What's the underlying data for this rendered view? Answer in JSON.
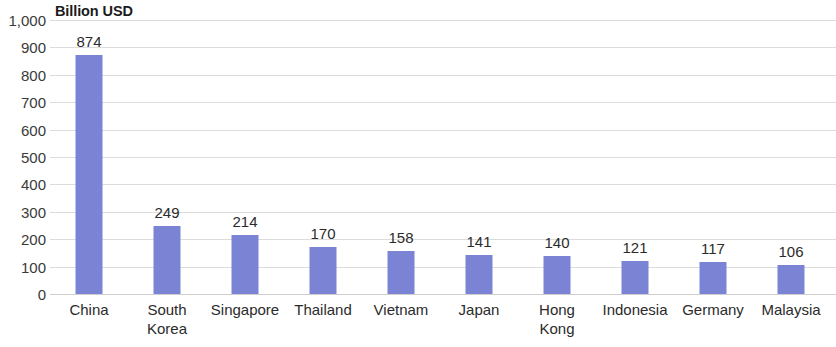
{
  "chart_data": {
    "type": "bar",
    "title": "Billion USD",
    "subtitle": "",
    "xlabel": "",
    "ylabel": "Billion USD",
    "ylim": [
      0,
      1000
    ],
    "ytick_step": 100,
    "grid": true,
    "legend": null,
    "bar_color": "#7b83d4",
    "gridline_color": "#dcdcdc",
    "categories": [
      "China",
      "South\nKorea",
      "Singapore",
      "Thailand",
      "Vietnam",
      "Japan",
      "Hong\nKong",
      "Indonesia",
      "Germany",
      "Malaysia"
    ],
    "values": [
      874,
      249,
      214,
      170,
      158,
      141,
      140,
      121,
      117,
      106
    ],
    "value_labels": [
      "874",
      "249",
      "214",
      "170",
      "158",
      "141",
      "140",
      "121",
      "117",
      "106"
    ],
    "ytick_labels": [
      "1,000",
      "900",
      "800",
      "700",
      "600",
      "500",
      "400",
      "300",
      "200",
      "100",
      "0"
    ],
    "ytick_values": [
      1000,
      900,
      800,
      700,
      600,
      500,
      400,
      300,
      200,
      100,
      0
    ]
  }
}
